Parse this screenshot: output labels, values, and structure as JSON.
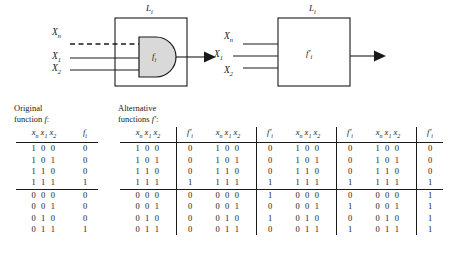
{
  "figure": {
    "diagram_left": {
      "name": "and-gate-block",
      "block_label": "L_i",
      "gate_label": "f_i",
      "inputs": [
        "X_n",
        "X_1",
        "X_2"
      ],
      "dashed_input": "X_n",
      "has_output_arrow": true,
      "gate_shape": "and-gate",
      "gate_fill": "#d9d9d9"
    },
    "diagram_right": {
      "name": "alternative-block",
      "block_label": "L_i",
      "gate_label": "f'_i",
      "inputs": [
        "X_n",
        "X_1",
        "X_2"
      ],
      "dashed_input": null,
      "has_output_arrow": true,
      "gate_shape": "rectangle",
      "gate_fill": "#ffffff"
    }
  },
  "tables": {
    "caption_original": [
      "Original",
      "function f:"
    ],
    "caption_alternative": [
      "Alternative",
      "functions f':"
    ],
    "header_x": "x_n x_1 x_2",
    "header_f_original": "f_i",
    "header_f_alternative": "f'_i",
    "rows_top": [
      "1 0 0",
      "1 0 1",
      "1 1 0",
      "1 1 1"
    ],
    "rows_bottom": [
      "0 0 0",
      "0 0 1",
      "0 1 0",
      "0 1 1"
    ],
    "blocks": [
      {
        "id": "original",
        "header": "f_i",
        "top_values": [
          "0",
          "0",
          "0",
          "1"
        ],
        "top_bold": [
          false,
          false,
          false,
          false
        ],
        "bottom_values": [
          "0",
          "0",
          "0",
          "1"
        ],
        "bottom_bold": [
          false,
          false,
          false,
          false
        ]
      },
      {
        "id": "alt-1",
        "header": "f'_i",
        "top_values": [
          "0",
          "0",
          "0",
          "1"
        ],
        "top_bold": [
          false,
          false,
          false,
          false
        ],
        "bottom_values": [
          "0",
          "0",
          "0",
          "0"
        ],
        "bottom_bold": [
          false,
          false,
          false,
          true
        ]
      },
      {
        "id": "alt-2",
        "header": "f'_i",
        "top_values": [
          "0",
          "0",
          "0",
          "1"
        ],
        "top_bold": [
          false,
          false,
          false,
          false
        ],
        "bottom_values": [
          "1",
          "0",
          "1",
          "0"
        ],
        "bottom_bold": [
          true,
          false,
          true,
          true
        ]
      },
      {
        "id": "alt-3",
        "header": "f'_i",
        "top_values": [
          "0",
          "0",
          "0",
          "1"
        ],
        "top_bold": [
          false,
          false,
          false,
          false
        ],
        "bottom_values": [
          "0",
          "1",
          "0",
          "1"
        ],
        "bottom_bold": [
          false,
          true,
          false,
          false
        ]
      },
      {
        "id": "alt-4",
        "header": "f'_i",
        "top_values": [
          "0",
          "0",
          "0",
          "1"
        ],
        "top_bold": [
          false,
          false,
          false,
          false
        ],
        "bottom_values": [
          "1",
          "1",
          "1",
          "1"
        ],
        "bottom_bold": [
          true,
          true,
          true,
          false
        ]
      }
    ]
  },
  "colors": {
    "ink": "#1a1a1a",
    "gate_fill": "#d9d9d9",
    "background": "#ffffff"
  }
}
